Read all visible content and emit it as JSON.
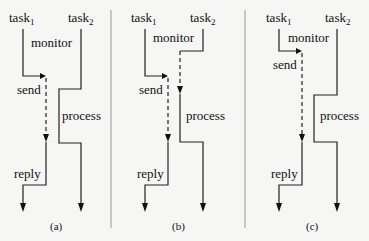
{
  "figure": {
    "type": "task interaction timing diagram",
    "panels": [
      {
        "caption": "(a)",
        "task1_label": "task",
        "task1_sub": "1",
        "task2_label": "task",
        "task2_sub": "2",
        "labels": {
          "monitor": "monitor",
          "send": "send",
          "process": "process",
          "reply": "reply"
        }
      },
      {
        "caption": "(b)",
        "task1_label": "task",
        "task1_sub": "1",
        "task2_label": "task",
        "task2_sub": "2",
        "labels": {
          "monitor": "monitor",
          "send": "send",
          "process": "process",
          "reply": "reply"
        }
      },
      {
        "caption": "(c)",
        "task1_label": "task",
        "task1_sub": "1",
        "task2_label": "task",
        "task2_sub": "2",
        "labels": {
          "monitor": "monitor",
          "send": "send",
          "process": "process",
          "reply": "reply"
        }
      }
    ]
  }
}
